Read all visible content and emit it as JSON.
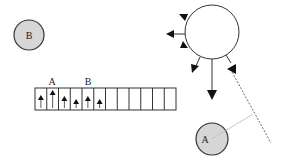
{
  "diagram": {
    "colors": {
      "circle_fill": "#d6d6d6",
      "stroke": "#333333",
      "big_circle_fill": "#ffffff",
      "connector": "#bbbbbb"
    },
    "circle_b": {
      "label": "B"
    },
    "circle_a": {
      "label": "A"
    },
    "strip": {
      "cell_count": 12,
      "labels": [
        {
          "text": "A",
          "cell": 1
        },
        {
          "text": "B",
          "cell": 4
        }
      ],
      "arrow_heights": [
        9,
        14,
        8,
        5,
        8,
        5,
        0,
        0,
        0,
        0,
        0,
        0
      ]
    },
    "big_circle": {
      "label": ""
    }
  }
}
